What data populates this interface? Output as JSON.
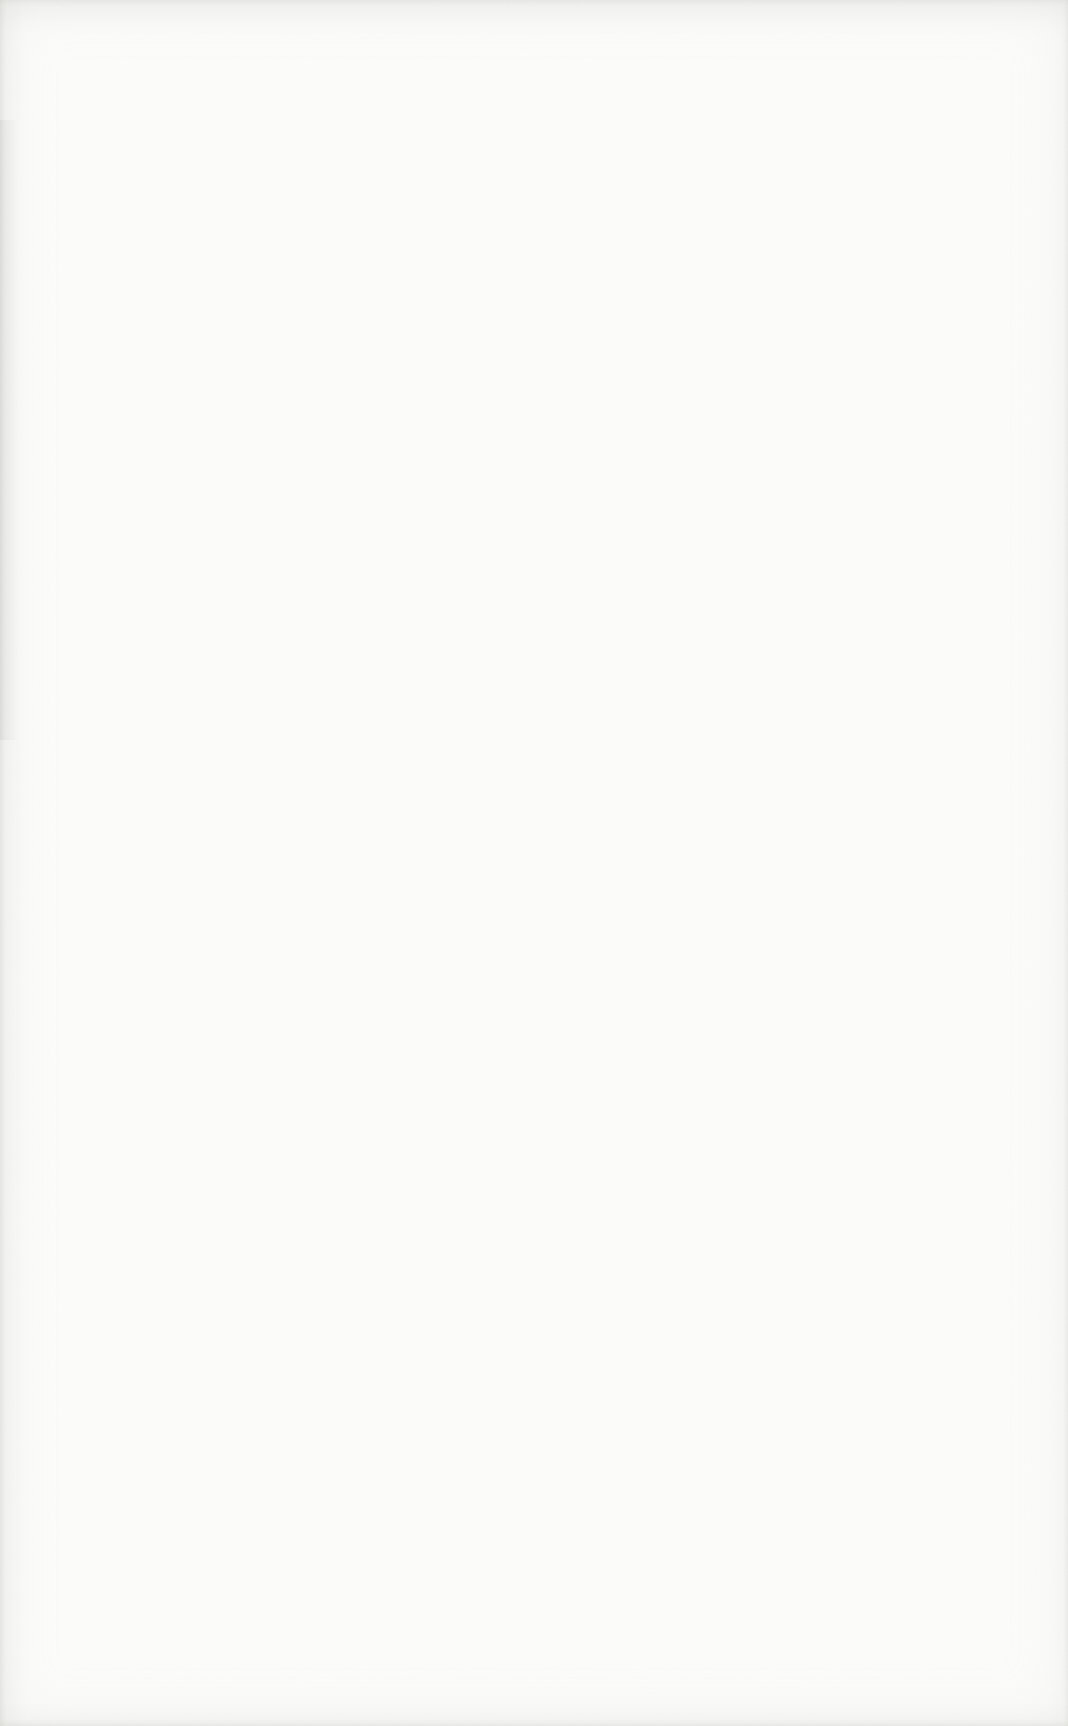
{
  "page": {
    "content": "",
    "paper_color": "#fcfcfb",
    "edge_shade_color": "#c8c8c4",
    "grain_color": "#b4b4b0"
  }
}
